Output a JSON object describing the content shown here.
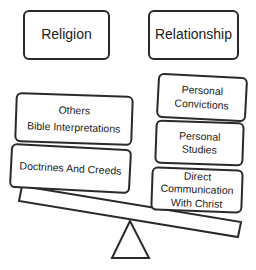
{
  "headers": {
    "left": "Religion",
    "right": "Relationship"
  },
  "left_side": {
    "items": [
      {
        "lines": [
          "Others",
          "Bible Interpretations"
        ]
      },
      {
        "lines": [
          "Doctrines And Creeds"
        ]
      }
    ]
  },
  "right_side": {
    "items": [
      {
        "lines": [
          "Personal",
          "Convictions"
        ]
      },
      {
        "lines": [
          "Personal",
          "Studies"
        ]
      },
      {
        "lines": [
          "Direct",
          "Communication",
          "With Christ"
        ]
      }
    ]
  },
  "colors": {
    "stroke": "#2a2a2a",
    "background": "#ffffff"
  }
}
